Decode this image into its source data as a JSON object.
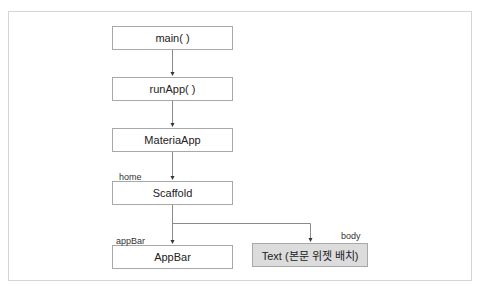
{
  "diagram": {
    "nodes": [
      {
        "id": "main",
        "label": "main( )"
      },
      {
        "id": "runApp",
        "label": "runApp( )"
      },
      {
        "id": "materiaApp",
        "label": "MateriaApp"
      },
      {
        "id": "scaffold",
        "label": "Scaffold"
      },
      {
        "id": "appBar",
        "label": "AppBar"
      },
      {
        "id": "text",
        "label": "Text (본문 위젯 배치)"
      }
    ],
    "edge_labels": {
      "home": "home",
      "appBar": "appBar",
      "body": "body"
    },
    "colors": {
      "highlight_fill": "#dcdcdc",
      "border": "#a8a8a8",
      "line": "#8a8a8a"
    }
  }
}
